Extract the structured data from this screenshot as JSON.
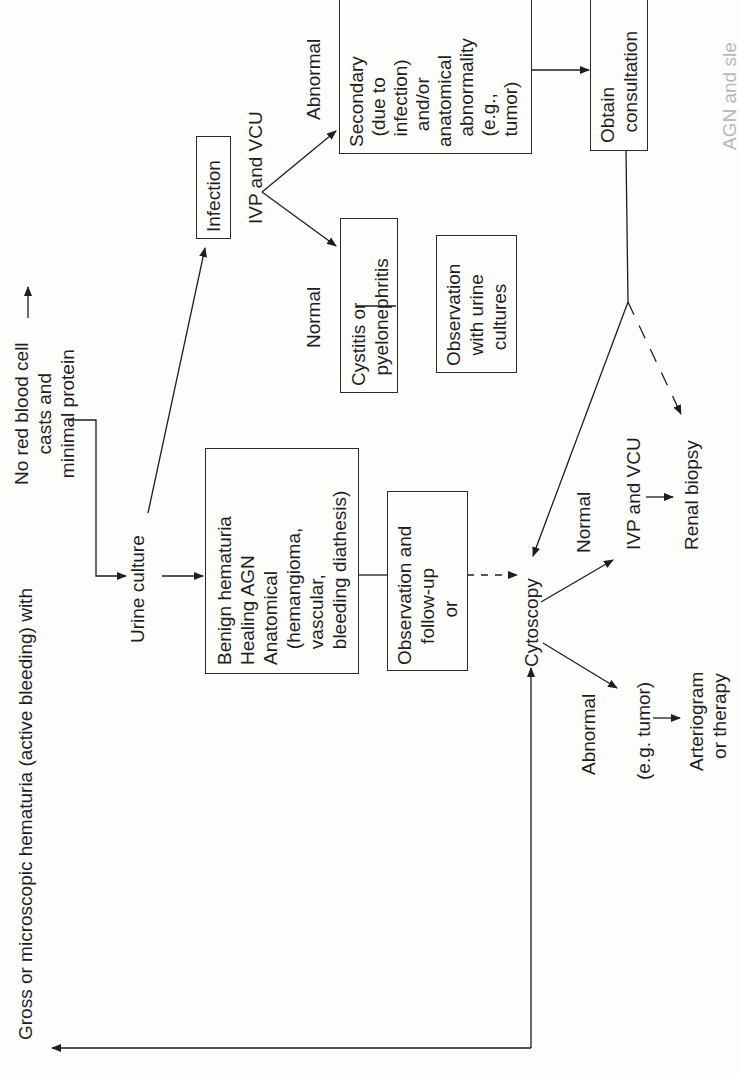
{
  "diagram": {
    "start": "Gross or microscopic hematuria (active bleeding) with",
    "no_rbc": "No red blood cell\ncasts and\nminimal protein",
    "urine_culture": "Urine culture",
    "benign_box": "Benign hematuria\nHealing AGN\nAnatomical\n   (hemangioma,\n   vascular,\n   bleeding diathesis)",
    "observation_followup_box": "Observation and\n    follow-up\n         or",
    "infection_box": "Infection",
    "ivp_vcu_1": "IVP and VCU",
    "normal_1": "Normal",
    "abnormal_1": "Abnormal",
    "cystitis_box": "Cystitis or\n  pyelonephritis",
    "observation_urine_box": "Observation\n  with urine\n   cultures",
    "secondary_box": "Secondary\n  (due to\n  infection)\n   and/or\nanatomical\n  abnormality\n  (e.g.,\n  tumor)",
    "consultation_box": "Obtain\n  consultation",
    "cytoscopy": "Cytoscopy",
    "normal_2": "Normal",
    "ivp_vcu_2": "IVP and VCU",
    "renal_biopsy": "Renal biopsy",
    "abnormal_2": "Abnormal",
    "eg_tumor": "(e.g. tumor)",
    "arteriogram": "Arteriogram\n  or therapy",
    "caption_fragment": "AGN and sle"
  },
  "colors": {
    "ink": "#1e1e1e",
    "paper": "#fdfdfb"
  }
}
